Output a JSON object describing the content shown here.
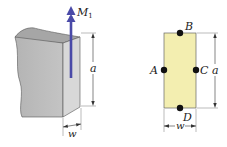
{
  "figure_left": {
    "moment_label": "M",
    "moment_subscript": "1",
    "height_label": "a",
    "width_label": "w"
  },
  "figure_right": {
    "points": {
      "top": "B",
      "left": "A",
      "right": "C",
      "bottom": "D"
    },
    "height_label": "a",
    "width_label": "w"
  },
  "colors": {
    "arrow": "#4a4aa8",
    "cross_section_fill": "#f3eeb0",
    "block_front": "#bdbdbd",
    "block_top": "#a9a9a9",
    "block_side": "#d6d6d6"
  }
}
